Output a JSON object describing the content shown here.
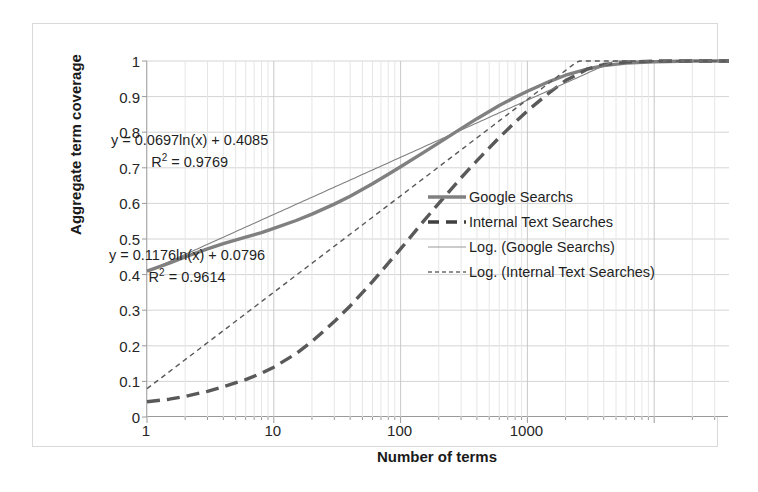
{
  "chart_data": {
    "type": "line",
    "title": "",
    "xlabel": "Number of terms",
    "ylabel": "Aggregate term coverage",
    "xscale": "log",
    "xlim": [
      1,
      38905
    ],
    "ylim": [
      0,
      1
    ],
    "grid": true,
    "legend_position": "center-right",
    "x_ticks": [
      {
        "value": 1,
        "label": "1"
      },
      {
        "value": 10,
        "label": "10"
      },
      {
        "value": 100,
        "label": "100"
      },
      {
        "value": 1000,
        "label": "1000"
      }
    ],
    "y_ticks": [
      {
        "value": 1,
        "label": "1"
      },
      {
        "value": 0.9,
        "label": "0.9"
      },
      {
        "value": 0.8,
        "label": "0.8"
      },
      {
        "value": 0.7,
        "label": "0.7"
      },
      {
        "value": 0.6,
        "label": "0.6"
      },
      {
        "value": 0.5,
        "label": "0.5"
      },
      {
        "value": 0.4,
        "label": "0.4"
      },
      {
        "value": 0.3,
        "label": "0.3"
      },
      {
        "value": 0.2,
        "label": "0.2"
      },
      {
        "value": 0.1,
        "label": "0.1"
      },
      {
        "value": 0,
        "label": "0"
      }
    ],
    "series": [
      {
        "name": "Google Searchs",
        "style": "solid-thick",
        "color": "#808080",
        "points": [
          [
            1,
            0.41
          ],
          [
            1.5,
            0.432
          ],
          [
            2,
            0.45
          ],
          [
            3,
            0.472
          ],
          [
            4,
            0.487
          ],
          [
            6,
            0.505
          ],
          [
            8,
            0.518
          ],
          [
            10,
            0.53
          ],
          [
            15,
            0.552
          ],
          [
            20,
            0.57
          ],
          [
            30,
            0.598
          ],
          [
            40,
            0.62
          ],
          [
            60,
            0.655
          ],
          [
            80,
            0.682
          ],
          [
            100,
            0.703
          ],
          [
            150,
            0.742
          ],
          [
            200,
            0.77
          ],
          [
            300,
            0.81
          ],
          [
            400,
            0.838
          ],
          [
            600,
            0.875
          ],
          [
            800,
            0.898
          ],
          [
            1000,
            0.915
          ],
          [
            1500,
            0.943
          ],
          [
            2000,
            0.96
          ],
          [
            3000,
            0.978
          ],
          [
            4000,
            0.987
          ],
          [
            6000,
            0.994
          ],
          [
            10000,
            0.998
          ],
          [
            20000,
            1.0
          ],
          [
            38905,
            1.0
          ]
        ]
      },
      {
        "name": "Internal Text Searches",
        "style": "dashed-thick",
        "color": "#595959",
        "points": [
          [
            1,
            0.043
          ],
          [
            1.5,
            0.05
          ],
          [
            2,
            0.058
          ],
          [
            3,
            0.072
          ],
          [
            4,
            0.085
          ],
          [
            6,
            0.105
          ],
          [
            8,
            0.123
          ],
          [
            10,
            0.14
          ],
          [
            15,
            0.178
          ],
          [
            20,
            0.212
          ],
          [
            30,
            0.268
          ],
          [
            40,
            0.312
          ],
          [
            60,
            0.38
          ],
          [
            80,
            0.432
          ],
          [
            100,
            0.472
          ],
          [
            150,
            0.548
          ],
          [
            200,
            0.6
          ],
          [
            300,
            0.672
          ],
          [
            400,
            0.72
          ],
          [
            600,
            0.785
          ],
          [
            800,
            0.828
          ],
          [
            1000,
            0.86
          ],
          [
            1500,
            0.912
          ],
          [
            2000,
            0.945
          ],
          [
            3000,
            0.978
          ],
          [
            4000,
            0.99
          ],
          [
            6000,
            0.997
          ],
          [
            10000,
            1.0
          ],
          [
            20000,
            1.0
          ],
          [
            38905,
            1.0
          ]
        ]
      },
      {
        "name": "Log. (Google Searchs)",
        "style": "solid-thin",
        "color": "#808080",
        "fit": {
          "slope": 0.0697,
          "intercept": 0.4085,
          "r2": 0.9769
        },
        "equation": "y = 0.0697ln(x) + 0.4085",
        "r2_text": "R² = 0.9769"
      },
      {
        "name": "Log. (Internal Text Searches)",
        "style": "dotted-thin",
        "color": "#595959",
        "fit": {
          "slope": 0.1176,
          "intercept": 0.0796,
          "r2": 0.9614
        },
        "equation": "y = 0.1176ln(x) + 0.0796",
        "r2_text": "R² = 0.9614"
      }
    ],
    "annotations": [
      {
        "id": "google-fit",
        "line1": "y = 0.0697ln(x) + 0.4085",
        "line2_prefix": "R",
        "line2_sup": "2",
        "line2_suffix": " = 0.9769"
      },
      {
        "id": "internal-fit",
        "line1": "y = 0.1176ln(x) + 0.0796",
        "line2_prefix": "R",
        "line2_sup": "2",
        "line2_suffix": " = 0.9614"
      }
    ],
    "legend": [
      {
        "label": "Google Searchs",
        "style": "solid-thick",
        "color": "#808080"
      },
      {
        "label": "Internal Text Searches",
        "style": "dashed-thick",
        "color": "#3f3f3f"
      },
      {
        "label": "Log. (Google Searchs)",
        "style": "solid-thin",
        "color": "#9a9a9a"
      },
      {
        "label": "Log. (Internal Text Searches)",
        "style": "dotted-thin",
        "color": "#6b6b6b"
      }
    ]
  }
}
